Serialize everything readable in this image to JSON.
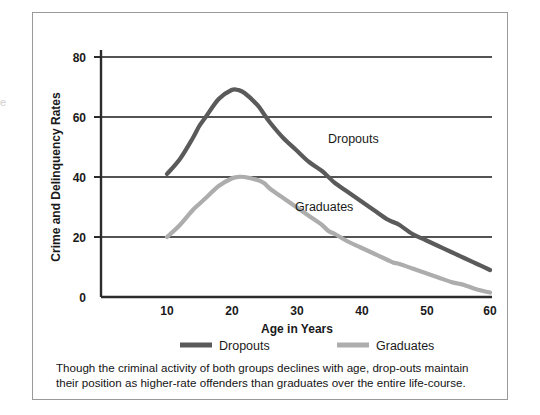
{
  "figure": {
    "background_color": "#ffffff",
    "frame_color": "#9a9a9a",
    "edge_artifact": "e"
  },
  "caption": {
    "line1": "Though the criminal activity of both groups declines with age, drop-outs maintain",
    "line2": "their position as higher-rate offenders than graduates over the entire life-course."
  },
  "legend": {
    "position": "below-axis",
    "entries": [
      {
        "label": "Dropouts",
        "color": "#5a5a5a"
      },
      {
        "label": "Graduates",
        "color": "#adadad"
      }
    ]
  },
  "inline_labels": {
    "dropouts": "Dropouts",
    "graduates": "Graduates"
  },
  "chart_data": {
    "type": "line",
    "title": "",
    "xlabel": "Age in Years",
    "ylabel": "Crime and Delinquency Rates",
    "xlim": [
      5,
      60
    ],
    "ylim": [
      0,
      80
    ],
    "xticks": [
      10,
      20,
      30,
      40,
      50,
      60
    ],
    "yticks": [
      0,
      20,
      40,
      60,
      80
    ],
    "xtick_labels": [
      "10",
      "20",
      "30",
      "40",
      "50",
      "60"
    ],
    "ytick_labels": [
      "0",
      "20",
      "40",
      "60",
      "80"
    ],
    "grid": "horizontal",
    "legend_position": "below",
    "x": [
      10,
      12,
      14,
      15,
      16,
      18,
      20,
      21,
      22,
      24,
      25,
      26,
      28,
      30,
      32,
      34,
      35,
      36,
      38,
      40,
      42,
      44,
      45,
      46,
      48,
      50,
      52,
      54,
      55,
      56,
      58,
      60
    ],
    "series": [
      {
        "name": "Dropouts",
        "color": "#5a5a5a",
        "values": [
          41,
          46,
          53,
          57,
          60,
          66,
          69,
          69,
          68,
          64,
          61,
          58,
          53,
          49,
          45,
          42,
          40,
          38,
          35,
          32,
          29,
          26,
          25,
          24,
          21,
          19,
          17,
          15,
          14,
          13,
          11,
          9
        ]
      },
      {
        "name": "Graduates",
        "color": "#adadad",
        "values": [
          20,
          24,
          29,
          31,
          33,
          37,
          39.5,
          40,
          40,
          39,
          38,
          36,
          33,
          30,
          27,
          24,
          22,
          21,
          18.5,
          16.5,
          14.5,
          12.5,
          11.5,
          11,
          9.5,
          8,
          6.5,
          5,
          4.5,
          4,
          2.5,
          1.5
        ]
      }
    ],
    "annotations": [
      {
        "text": "Dropouts",
        "x": 36,
        "y": 51
      },
      {
        "text": "Graduates",
        "x": 32,
        "y": 31
      }
    ]
  }
}
